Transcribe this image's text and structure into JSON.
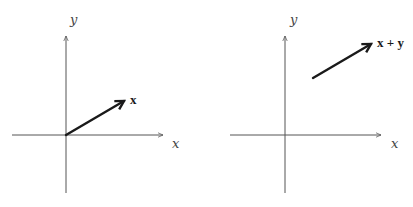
{
  "panels": [
    {
      "id": "left",
      "axes": {
        "x_label": "x",
        "y_label": "y"
      },
      "vector": {
        "label": "x",
        "from": [
          0,
          0
        ],
        "to": [
          1.0,
          0.58
        ],
        "origin_at_axes": true
      }
    },
    {
      "id": "right",
      "axes": {
        "x_label": "x",
        "y_label": "y"
      },
      "vector": {
        "label": "x + y",
        "from": [
          0.47,
          0.98
        ],
        "to": [
          1.47,
          1.56
        ],
        "origin_at_axes": false
      }
    }
  ],
  "colors": {
    "axis": "#555555",
    "vector": "#1a1a1a",
    "background": "#ffffff"
  }
}
